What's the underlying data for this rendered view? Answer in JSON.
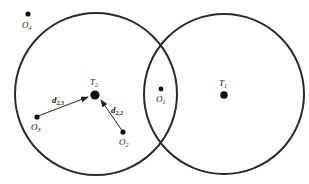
{
  "diagram": {
    "circles": [
      {
        "id": "coverage-T2",
        "center_node": "T2"
      },
      {
        "id": "coverage-T1",
        "center_node": "T1"
      }
    ],
    "nodes": [
      {
        "id": "O4",
        "kind": "object",
        "label": "O",
        "sub": "4"
      },
      {
        "id": "T2",
        "kind": "target",
        "label": "T",
        "sub": "2"
      },
      {
        "id": "O3",
        "kind": "object",
        "label": "O",
        "sub": "3"
      },
      {
        "id": "O2",
        "kind": "object",
        "label": "O",
        "sub": "2"
      },
      {
        "id": "O1",
        "kind": "object",
        "label": "O",
        "sub": "1"
      },
      {
        "id": "T1",
        "kind": "target",
        "label": "T",
        "sub": "1"
      }
    ],
    "arrows": [
      {
        "from": "O3",
        "to": "T2",
        "label": "d",
        "sub": "2,3"
      },
      {
        "from": "O2",
        "to": "T2",
        "label": "d",
        "sub": "2,2"
      }
    ],
    "colors": {
      "stroke": "#2a2a2a",
      "dot": "#111111",
      "background": "#ffffff"
    }
  }
}
